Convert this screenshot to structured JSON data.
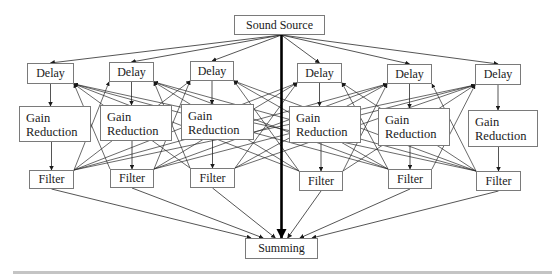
{
  "diagram": {
    "source": {
      "label": "Sound Source",
      "x": 234,
      "y": 15,
      "w": 91,
      "h": 20
    },
    "sum": {
      "label": "Summing",
      "x": 245,
      "y": 238,
      "w": 73,
      "h": 21
    },
    "channels": [
      {
        "delay": {
          "label": "Delay",
          "x": 27,
          "y": 63,
          "w": 47,
          "h": 21
        },
        "gain": {
          "line1": "Gain",
          "line2": "Reduction",
          "x": 19,
          "y": 106,
          "w": 72,
          "h": 36
        },
        "filter": {
          "label": "Filter",
          "x": 29,
          "y": 170,
          "w": 45,
          "h": 19
        }
      },
      {
        "delay": {
          "label": "Delay",
          "x": 109,
          "y": 62,
          "w": 45,
          "h": 20
        },
        "gain": {
          "line1": "Gain",
          "line2": "Reduction",
          "x": 100,
          "y": 105,
          "w": 72,
          "h": 36
        },
        "filter": {
          "label": "Filter",
          "x": 110,
          "y": 169,
          "w": 44,
          "h": 19
        }
      },
      {
        "delay": {
          "label": "Delay",
          "x": 190,
          "y": 61,
          "w": 44,
          "h": 20
        },
        "gain": {
          "line1": "Gain",
          "line2": "Reduction",
          "x": 181,
          "y": 104,
          "w": 73,
          "h": 36
        },
        "filter": {
          "label": "Filter",
          "x": 190,
          "y": 168,
          "w": 45,
          "h": 20
        }
      },
      {
        "delay": {
          "label": "Delay",
          "x": 297,
          "y": 63,
          "w": 45,
          "h": 20
        },
        "gain": {
          "line1": "Gain",
          "line2": "Reduction",
          "x": 289,
          "y": 106,
          "w": 72,
          "h": 37
        },
        "filter": {
          "label": "Filter",
          "x": 299,
          "y": 171,
          "w": 44,
          "h": 20
        }
      },
      {
        "delay": {
          "label": "Delay",
          "x": 387,
          "y": 64,
          "w": 45,
          "h": 20
        },
        "gain": {
          "line1": "Gain",
          "line2": "Reduction",
          "x": 378,
          "y": 108,
          "w": 72,
          "h": 38
        },
        "filter": {
          "label": "Filter",
          "x": 388,
          "y": 169,
          "w": 44,
          "h": 20
        }
      },
      {
        "delay": {
          "label": "Delay",
          "x": 475,
          "y": 64,
          "w": 46,
          "h": 21
        },
        "gain": {
          "line1": "Gain",
          "line2": "Reduction",
          "x": 468,
          "y": 110,
          "w": 70,
          "h": 37
        },
        "filter": {
          "label": "Filter",
          "x": 476,
          "y": 171,
          "w": 45,
          "h": 20
        }
      }
    ],
    "colors": {
      "line": "#2a2a2a",
      "box_border": "#7a7a7a",
      "direct_path": "#000000",
      "bar": "#c4c4c4"
    }
  }
}
